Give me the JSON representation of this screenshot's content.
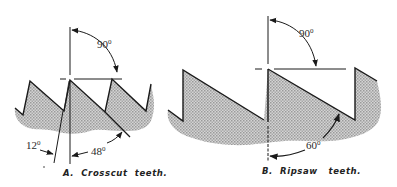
{
  "figures": [
    {
      "id": "A",
      "caption": "A.  Crosscut  teeth.",
      "angles": [
        {
          "label": "90",
          "sup": "0"
        },
        {
          "label": "12",
          "sup": "0"
        },
        {
          "label": "48",
          "sup": "0"
        }
      ]
    },
    {
      "id": "B",
      "caption": "B.  Ripsaw   teeth.",
      "angles": [
        {
          "label": "90",
          "sup": "0"
        },
        {
          "label": "60",
          "sup": "0"
        }
      ]
    }
  ],
  "colors": {
    "line": "#1a1a1a",
    "shade": "#b9b9b9"
  }
}
